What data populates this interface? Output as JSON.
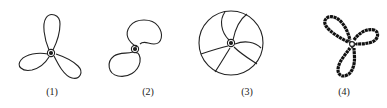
{
  "figures": [
    {
      "label": "(1)",
      "description": "three-blade propeller, slender petal blades"
    },
    {
      "label": "(2)",
      "description": "two-blade propeller, bean-shaped blades"
    },
    {
      "label": "(3)",
      "description": "three-blade propeller inside circular guard"
    },
    {
      "label": "(4)",
      "description": "three-blade propeller, thick jagged outline"
    }
  ],
  "colors": {
    "stroke": "#222222",
    "background": "#ffffff"
  }
}
